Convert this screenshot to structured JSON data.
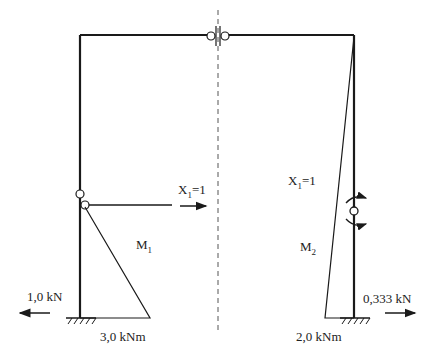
{
  "diagram": {
    "type": "frame bending moment diagrams",
    "labels": {
      "x1_left": {
        "base": "X",
        "sub": "1",
        "rest": "=1"
      },
      "x1_right": {
        "base": "X",
        "sub": "1",
        "rest": "=1"
      },
      "m1": {
        "base": "M",
        "sub": "1"
      },
      "m2": {
        "base": "M",
        "sub": "2"
      },
      "reaction_left": "1,0 kN",
      "reaction_right": "0,333 kN",
      "moment_left": "3,0 kNm",
      "moment_right": "2,0 kNm"
    },
    "colors": {
      "line": "#1a1a1a",
      "background": "#ffffff"
    }
  }
}
